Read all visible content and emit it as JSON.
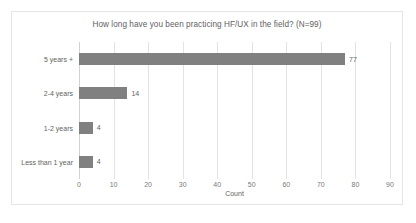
{
  "chart_data": {
    "type": "bar",
    "orientation": "horizontal",
    "title": "How long have you been practicing HF/UX in the field? (N=99)",
    "xlabel": "Count",
    "ylabel": "",
    "categories": [
      "5 years +",
      "2-4 years",
      "1-2 years",
      "Less than 1 year"
    ],
    "values": [
      77,
      14,
      4,
      4
    ],
    "data_labels": [
      "77",
      "14",
      "4",
      "4"
    ],
    "xlim": [
      0,
      90
    ],
    "xticks": [
      0,
      10,
      20,
      30,
      40,
      50,
      60,
      70,
      80,
      90
    ],
    "xtick_labels": [
      "0",
      "10",
      "20",
      "30",
      "40",
      "50",
      "60",
      "70",
      "80",
      "90"
    ],
    "grid": "vertical",
    "legend": "none",
    "bar_color": "#808080",
    "gridline_color": "#e3e3e3",
    "text_color": "#5f5f5f",
    "plot_background": "#ffffff",
    "frame_border_color": "#e6e6e6"
  },
  "caption": {
    "text": ""
  }
}
